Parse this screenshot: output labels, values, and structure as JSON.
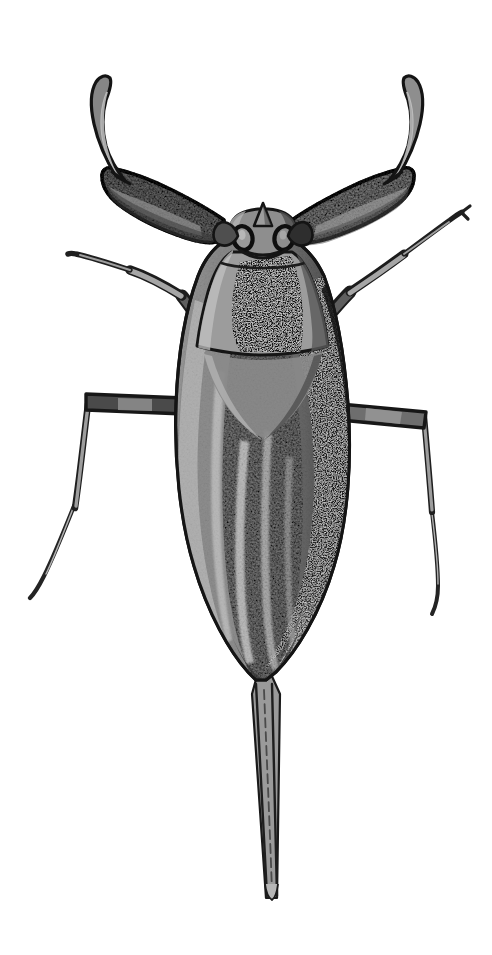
{
  "image": {
    "kind": "scientific-illustration",
    "subject_common_name": "Water scorpion",
    "subject_family": "Nepidae",
    "view": "dorsal",
    "technique": "grayscale ink and wash drawing",
    "background_color": "#ffffff",
    "width": 492,
    "height": 955
  },
  "palette": {
    "background": "#ffffff",
    "outline": "#161616",
    "black": "#111111",
    "dark_gray": "#3f3f3f",
    "mid_dark_gray": "#5d5d5d",
    "mid_gray": "#777777",
    "body_gray": "#8a8a8a",
    "light_gray": "#a8a8a8",
    "pale_gray": "#c2c2c2",
    "highlight": "#d8d8d8"
  },
  "anatomy": {
    "head": {
      "label": "head",
      "eye_left": "compound-eye-left",
      "eye_right": "compound-eye-right",
      "rostrum": "rostrum"
    },
    "thorax": {
      "pronotum": "pronotum",
      "scutellum": "scutellum",
      "dark_patch": "pronotum-dark-patch"
    },
    "abdomen": {
      "label": "abdomen",
      "left_hemelytron": "left-forewing",
      "right_hemelytron": "right-forewing",
      "membrane_shadow": "right-dark-membrane",
      "highlight_streaks": 4
    },
    "siphon": {
      "label": "respiratory-siphon",
      "description": "long slender breathing tube",
      "top_y": 678,
      "bottom_y": 901
    },
    "legs": {
      "foreleg_left": "raptorial-foreleg-left",
      "foreleg_right": "raptorial-foreleg-right",
      "midleg_left": "midleg-left",
      "midleg_right": "midleg-right",
      "hindleg_left": "hindleg-left",
      "hindleg_right": "hindleg-right"
    }
  },
  "geometry": {
    "body_outline": "M 248 232 C 224 236 208 250 198 276 C 186 308 178 352 176 404 C 174 460 180 520 194 566 C 208 614 230 652 248 672 L 256 680 L 266 680 L 276 672 C 296 652 320 614 334 566 C 348 520 352 460 348 404 C 344 352 336 308 324 276 C 312 250 294 236 270 232 Z",
    "pronotum": "M 232 252 C 222 258 214 272 208 292 C 203 310 199 330 197 346 C 218 352 246 355 262 355 C 280 355 308 352 328 346 C 326 330 322 310 316 292 C 310 272 302 258 292 252 Z",
    "scutellum": "M 204 352 C 216 356 240 360 262 360 C 286 360 310 356 322 352 C 314 392 292 424 263 438 C 234 424 212 392 204 352 Z",
    "left_wing": "M 196 300 C 185 340 178 390 177 440 C 176 498 184 552 198 592 C 212 634 234 664 254 676 L 258 600 L 256 460 L 250 360 Z",
    "right_wing": "M 328 300 C 339 340 346 390 347 440 C 348 498 340 552 326 592 C 312 634 290 664 270 676 L 266 600 L 268 460 L 274 360 Z",
    "siphon": "M 256 676 L 250 690 L 266 898 L 276 898 L 278 690 L 268 676 Z"
  },
  "a11y": {
    "alt_text": "Grayscale dorsal illustration of a water scorpion with raptorial forelegs, broad oval body and a long slender tail siphon."
  }
}
